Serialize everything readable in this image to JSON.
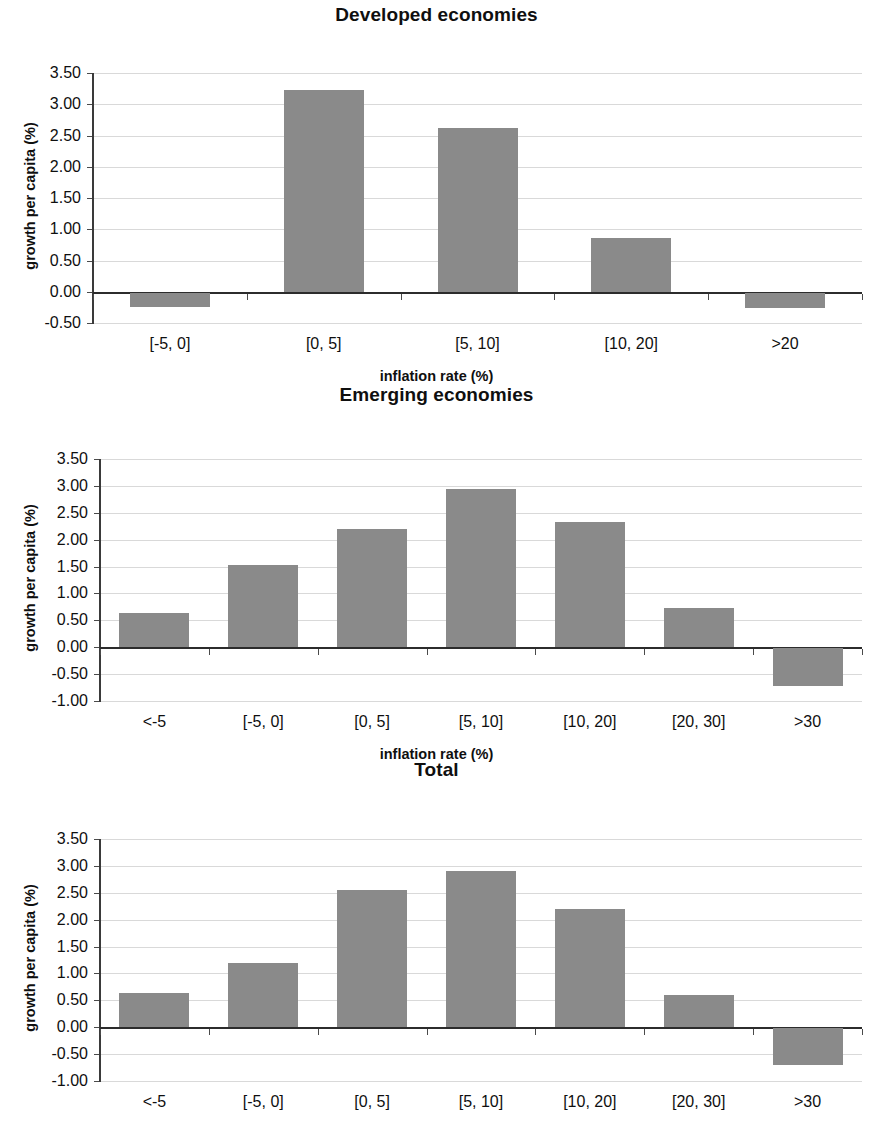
{
  "figure": {
    "panel_count": 3,
    "bar_color": "#8a8a8a",
    "grid_color": "#d9d9d9",
    "axis_color": "#2c2c2c"
  },
  "panels": [
    {
      "title": "Developed economies",
      "ylabel": "growth per capita (%)",
      "xlabel": "inflation rate (%)",
      "yticks": [
        "3.50",
        "3.00",
        "2.50",
        "2.00",
        "1.50",
        "1.00",
        "0.50",
        "0.00",
        "-0.50"
      ],
      "xticks": [
        "[-5, 0]",
        "[0, 5]",
        "[5, 10]",
        "[10, 20]",
        ">20"
      ]
    },
    {
      "title": "Emerging economies",
      "ylabel": "growth per capita (%)",
      "xlabel": "inflation rate (%)",
      "yticks": [
        "3.50",
        "3.00",
        "2.50",
        "2.00",
        "1.50",
        "1.00",
        "0.50",
        "0.00",
        "-0.50",
        "-1.00"
      ],
      "xticks": [
        "<-5",
        "[-5, 0]",
        "[0, 5]",
        "[5, 10]",
        "[10, 20]",
        "[20, 30]",
        ">30"
      ]
    },
    {
      "title": "Total",
      "ylabel": "growth per capita (%)",
      "xlabel": "inflation rate (%)",
      "yticks": [
        "3.50",
        "3.00",
        "2.50",
        "2.00",
        "1.50",
        "1.00",
        "0.50",
        "0.00",
        "-0.50",
        "-1.00"
      ],
      "xticks": [
        "<-5",
        "[-5, 0]",
        "[0, 5]",
        "[5, 10]",
        "[10, 20]",
        "[20, 30]",
        ">30"
      ]
    }
  ],
  "chart_data": [
    {
      "type": "bar",
      "title": "Developed economies",
      "xlabel": "inflation rate (%)",
      "ylabel": "growth per capita (%)",
      "categories": [
        "[-5, 0]",
        "[0, 5]",
        "[5, 10]",
        "[10, 20]",
        ">20"
      ],
      "values": [
        -0.22,
        3.23,
        2.62,
        0.86,
        -0.24
      ],
      "ylim": [
        -0.5,
        3.5
      ],
      "ytick_step": 0.5,
      "grid": true,
      "legend": null
    },
    {
      "type": "bar",
      "title": "Emerging economies",
      "xlabel": "inflation rate (%)",
      "ylabel": "growth per capita (%)",
      "categories": [
        "<-5",
        "[-5, 0]",
        "[0, 5]",
        "[5, 10]",
        "[10, 20]",
        "[20, 30]",
        ">30"
      ],
      "values": [
        0.63,
        1.53,
        2.2,
        2.94,
        2.32,
        0.73,
        -0.71
      ],
      "ylim": [
        -1.0,
        3.5
      ],
      "ytick_step": 0.5,
      "grid": true,
      "legend": null
    },
    {
      "type": "bar",
      "title": "Total",
      "xlabel": "inflation rate (%)",
      "ylabel": "growth per capita (%)",
      "categories": [
        "<-5",
        "[-5, 0]",
        "[0, 5]",
        "[5, 10]",
        "[10, 20]",
        "[20, 30]",
        ">30"
      ],
      "values": [
        0.63,
        1.2,
        2.55,
        2.9,
        2.19,
        0.6,
        -0.68
      ],
      "ylim": [
        -1.0,
        3.5
      ],
      "ytick_step": 0.5,
      "grid": true,
      "legend": null
    }
  ]
}
